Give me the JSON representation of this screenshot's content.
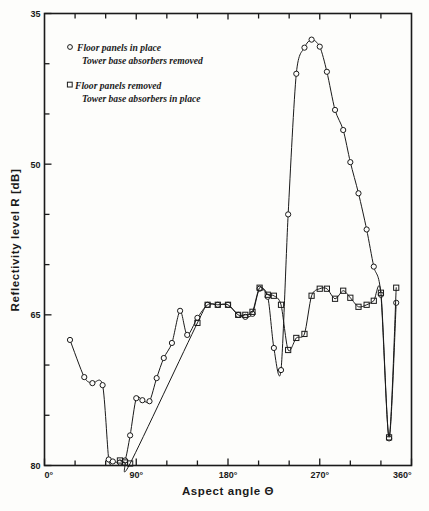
{
  "chart_data": {
    "type": "line",
    "title": "",
    "xlabel": "Aspect angle Θ",
    "ylabel": "Reflectivity level R [dB]",
    "xlim": [
      0,
      360
    ],
    "ylim": [
      80,
      35
    ],
    "y_inverted": true,
    "grid": false,
    "x_tick_labels": [
      "0°",
      "90°",
      "180°",
      "270°",
      "360°"
    ],
    "x_tick_values": [
      0,
      90,
      180,
      270,
      360
    ],
    "x_minor_step": 30,
    "y_tick_labels": [
      "35",
      "50",
      "65",
      "80"
    ],
    "y_tick_values": [
      35,
      50,
      65,
      80
    ],
    "y_minor_step": 5,
    "legend_position": "upper-left",
    "series": [
      {
        "name": "Floor panels in place / Tower base absorbers removed",
        "marker": "circle",
        "legend_line1": "Floor panels in place",
        "legend_line2": "Tower base absorbers removed",
        "x": [
          25,
          39,
          47,
          57,
          63,
          67,
          74,
          79,
          84,
          90,
          96,
          103,
          110,
          117,
          125,
          133,
          140,
          150,
          160,
          170,
          180,
          190,
          197,
          204,
          211,
          219,
          225,
          232,
          239,
          247,
          255,
          262,
          270,
          277,
          285,
          293,
          300,
          308,
          316,
          323,
          330,
          338,
          345
        ],
        "y": [
          67.5,
          71.2,
          71.8,
          72.0,
          79.4,
          79.6,
          79.7,
          79.5,
          77.0,
          73.3,
          73.5,
          73.6,
          71.3,
          69.3,
          67.8,
          64.6,
          67.0,
          65.3,
          64.0,
          64.0,
          64.0,
          65.0,
          65.2,
          64.9,
          62.4,
          63.2,
          68.3,
          70.5,
          55.0,
          41.0,
          38.4,
          37.6,
          38.3,
          40.8,
          44.6,
          46.6,
          49.8,
          52.9,
          56.5,
          60.2,
          63.0,
          77.3,
          63.8
        ]
      },
      {
        "name": "Floor panels removed / Tower base absorbers in place",
        "marker": "square",
        "legend_line1": "Floor panels removed",
        "legend_line2": "Tower base absorbers in place",
        "x": [
          74,
          79,
          84,
          150,
          160,
          170,
          180,
          190,
          197,
          204,
          211,
          219,
          225,
          232,
          239,
          247,
          255,
          262,
          270,
          277,
          285,
          293,
          300,
          308,
          316,
          323,
          330,
          338,
          345
        ],
        "y": [
          79.5,
          79.7,
          79.8,
          65.8,
          64.0,
          64.0,
          64.0,
          65.0,
          65.0,
          64.7,
          62.3,
          63.0,
          63.1,
          64.0,
          68.5,
          67.3,
          66.9,
          63.1,
          62.4,
          62.4,
          63.4,
          62.6,
          63.3,
          64.2,
          64.0,
          63.6,
          62.8,
          77.2,
          62.3
        ]
      }
    ]
  }
}
